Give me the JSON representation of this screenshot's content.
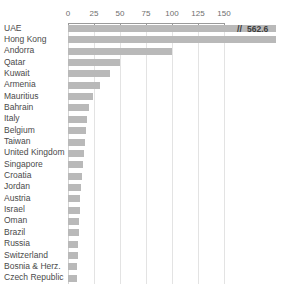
{
  "chart_data": {
    "type": "bar",
    "orientation": "horizontal",
    "title": "",
    "subtitle": "",
    "xlabel": "",
    "ylabel": "",
    "xlim": [
      0,
      150
    ],
    "grid": true,
    "legend": null,
    "axis_position": "top",
    "tick_labels": [
      "0",
      "25",
      "50",
      "75",
      "100",
      "125",
      "150"
    ],
    "ticks": [
      0,
      25,
      50,
      75,
      100,
      125,
      150
    ],
    "categories": [
      "UAE",
      "Hong Kong",
      "Andorra",
      "Qatar",
      "Kuwait",
      "Armenia",
      "Mauritius",
      "Bahrain",
      "Italy",
      "Belgium",
      "Taiwan",
      "United Kingdom",
      "Singapore",
      "Croatia",
      "Jordan",
      "Austria",
      "Israel",
      "Oman",
      "Brazil",
      "Russia",
      "Switzerland",
      "Bosnia & Herz.",
      "Czech Republic"
    ],
    "values": [
      562.6,
      170,
      100,
      50,
      40,
      31,
      24,
      20,
      18,
      17,
      16,
      15,
      14,
      13,
      12.5,
      12,
      11.5,
      11,
      10.5,
      10,
      9.5,
      9,
      8.5
    ],
    "annotations": [
      {
        "category": "UAE",
        "text": "562.6",
        "marker": "//",
        "note": "axis break; bar truncated at plot edge"
      }
    ],
    "bar_color": "#b9b9b9",
    "gridline_color": "#e3e3e3",
    "axis_color": "#9a9a9a"
  },
  "colors": {
    "bar": "#b9b9b9",
    "grid": "#e3e3e3",
    "axis": "#9a9a9a",
    "text": "#4a4a4a",
    "annotation": "#3c3c3c",
    "background": "#ffffff"
  }
}
